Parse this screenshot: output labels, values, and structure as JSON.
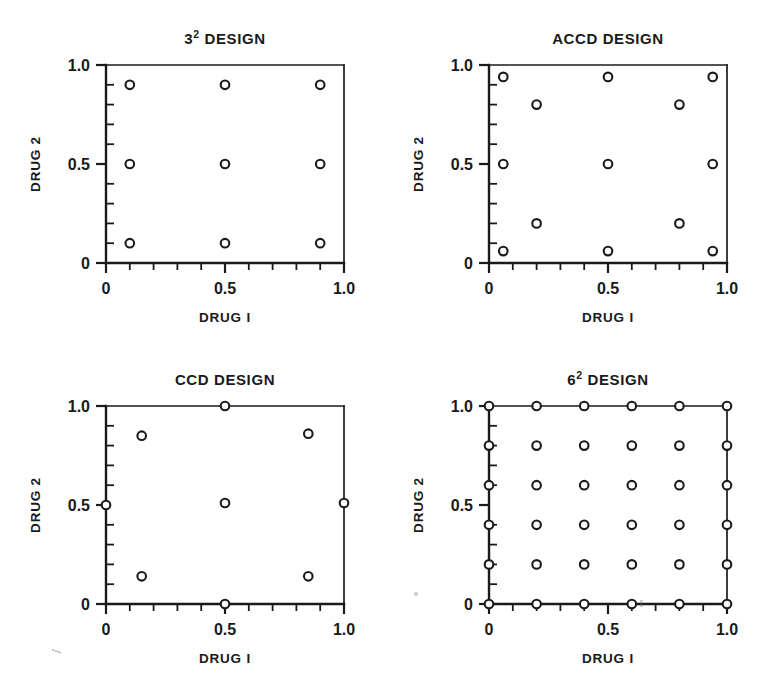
{
  "figure": {
    "background_color": "#ffffff",
    "ink_color": "#1a1a1a",
    "panel_count": 4
  },
  "labels": {
    "xlabel": "DRUG I",
    "ylabel": "DRUG 2",
    "design_word": "DESIGN",
    "x_ticks": [
      "0",
      "0.5",
      "1.0"
    ],
    "y_ticks": [
      "0",
      "0.5",
      "1.0"
    ]
  },
  "chart_data": [
    {
      "id": "panel-3sq",
      "type": "scatter",
      "title": "3² DESIGN",
      "title_base": "3",
      "title_exponent": "2",
      "xlabel": "DRUG I",
      "ylabel": "DRUG 2",
      "xlim": [
        0,
        1
      ],
      "ylim": [
        0,
        1
      ],
      "xticks": [
        0,
        0.5,
        1.0
      ],
      "yticks": [
        0,
        0.5,
        1.0
      ],
      "xticklabels": [
        "0",
        "0.5",
        "1.0"
      ],
      "yticklabels": [
        "0",
        "0.5",
        "1.0"
      ],
      "minor_tick_step": 0.1,
      "grid": false,
      "legend": "none",
      "marker": "open-circle",
      "n_points": 9,
      "points": [
        [
          0.1,
          0.1
        ],
        [
          0.5,
          0.1
        ],
        [
          0.9,
          0.1
        ],
        [
          0.1,
          0.5
        ],
        [
          0.5,
          0.5
        ],
        [
          0.9,
          0.5
        ],
        [
          0.1,
          0.9
        ],
        [
          0.5,
          0.9
        ],
        [
          0.9,
          0.9
        ]
      ]
    },
    {
      "id": "panel-accd",
      "type": "scatter",
      "title": "ACCD DESIGN",
      "title_base": "ACCD",
      "title_exponent": "",
      "xlabel": "DRUG I",
      "ylabel": "DRUG 2",
      "xlim": [
        0,
        1
      ],
      "ylim": [
        0,
        1
      ],
      "xticks": [
        0,
        0.5,
        1.0
      ],
      "yticks": [
        0,
        0.5,
        1.0
      ],
      "xticklabels": [
        "0",
        "0.5",
        "1.0"
      ],
      "yticklabels": [
        "0",
        "0.5",
        "1.0"
      ],
      "minor_tick_step": 0.1,
      "grid": false,
      "legend": "none",
      "marker": "open-circle",
      "n_points": 13,
      "points": [
        [
          0.06,
          0.06
        ],
        [
          0.5,
          0.06
        ],
        [
          0.94,
          0.06
        ],
        [
          0.2,
          0.2
        ],
        [
          0.8,
          0.2
        ],
        [
          0.06,
          0.5
        ],
        [
          0.5,
          0.5
        ],
        [
          0.94,
          0.5
        ],
        [
          0.2,
          0.8
        ],
        [
          0.8,
          0.8
        ],
        [
          0.06,
          0.94
        ],
        [
          0.5,
          0.94
        ],
        [
          0.94,
          0.94
        ]
      ]
    },
    {
      "id": "panel-ccd",
      "type": "scatter",
      "title": "CCD DESIGN",
      "title_base": "CCD",
      "title_exponent": "",
      "xlabel": "DRUG I",
      "ylabel": "DRUG 2",
      "xlim": [
        0,
        1
      ],
      "ylim": [
        0,
        1
      ],
      "xticks": [
        0,
        0.5,
        1.0
      ],
      "yticks": [
        0,
        0.5,
        1.0
      ],
      "xticklabels": [
        "0",
        "0.5",
        "1.0"
      ],
      "yticklabels": [
        "0",
        "0.5",
        "1.0"
      ],
      "minor_tick_step": 0.1,
      "grid": false,
      "legend": "none",
      "marker": "open-circle",
      "n_points": 9,
      "points": [
        [
          0.5,
          0.0
        ],
        [
          0.15,
          0.14
        ],
        [
          0.85,
          0.14
        ],
        [
          0.0,
          0.5
        ],
        [
          0.5,
          0.51
        ],
        [
          1.0,
          0.51
        ],
        [
          0.15,
          0.85
        ],
        [
          0.85,
          0.86
        ],
        [
          0.5,
          1.0
        ]
      ]
    },
    {
      "id": "panel-6sq",
      "type": "scatter",
      "title": "6² DESIGN",
      "title_base": "6",
      "title_exponent": "2",
      "xlabel": "DRUG I",
      "ylabel": "DRUG 2",
      "xlim": [
        0,
        1
      ],
      "ylim": [
        0,
        1
      ],
      "xticks": [
        0,
        0.5,
        1.0
      ],
      "yticks": [
        0,
        0.5,
        1.0
      ],
      "xticklabels": [
        "0",
        "0.5",
        "1.0"
      ],
      "yticklabels": [
        "0",
        "0.5",
        "1.0"
      ],
      "minor_tick_step": 0.1,
      "grid": false,
      "legend": "none",
      "marker": "open-circle",
      "n_points": 36,
      "grid_levels": [
        0.0,
        0.2,
        0.4,
        0.6,
        0.8,
        1.0
      ],
      "points": [
        [
          0.0,
          0.0
        ],
        [
          0.2,
          0.0
        ],
        [
          0.4,
          0.0
        ],
        [
          0.6,
          0.0
        ],
        [
          0.8,
          0.0
        ],
        [
          1.0,
          0.0
        ],
        [
          0.0,
          0.2
        ],
        [
          0.2,
          0.2
        ],
        [
          0.4,
          0.2
        ],
        [
          0.6,
          0.2
        ],
        [
          0.8,
          0.2
        ],
        [
          1.0,
          0.2
        ],
        [
          0.0,
          0.4
        ],
        [
          0.2,
          0.4
        ],
        [
          0.4,
          0.4
        ],
        [
          0.6,
          0.4
        ],
        [
          0.8,
          0.4
        ],
        [
          1.0,
          0.4
        ],
        [
          0.0,
          0.6
        ],
        [
          0.2,
          0.6
        ],
        [
          0.4,
          0.6
        ],
        [
          0.6,
          0.6
        ],
        [
          0.8,
          0.6
        ],
        [
          1.0,
          0.6
        ],
        [
          0.0,
          0.8
        ],
        [
          0.2,
          0.8
        ],
        [
          0.4,
          0.8
        ],
        [
          0.6,
          0.8
        ],
        [
          0.8,
          0.8
        ],
        [
          1.0,
          0.8
        ],
        [
          0.0,
          1.0
        ],
        [
          0.2,
          1.0
        ],
        [
          0.4,
          1.0
        ],
        [
          0.6,
          1.0
        ],
        [
          0.8,
          1.0
        ],
        [
          1.0,
          1.0
        ]
      ]
    }
  ]
}
